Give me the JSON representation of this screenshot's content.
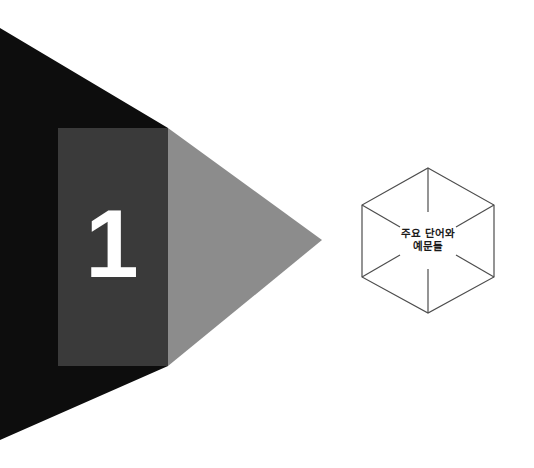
{
  "page": {
    "width": 534,
    "height": 468,
    "background_color": "#ffffff",
    "kind": "chapter-opener"
  },
  "chapter": {
    "number": "1",
    "number_color": "#ffffff"
  },
  "artwork": {
    "name": "arrow-chevron-composition",
    "shapes": [
      {
        "name": "black-chevron",
        "color": "#0d0d0d"
      },
      {
        "name": "dark-gray-band",
        "color": "#3a3a3a"
      },
      {
        "name": "mid-gray-arrow",
        "color": "#8c8c8c"
      }
    ]
  },
  "hexagon": {
    "name": "hexagon-badge",
    "stroke_color": "#4d4d4d",
    "fill_color": "#ffffff",
    "label_line1": "주요 단어와",
    "label_line2": "예문들",
    "label_color": "#1a1a1a"
  }
}
